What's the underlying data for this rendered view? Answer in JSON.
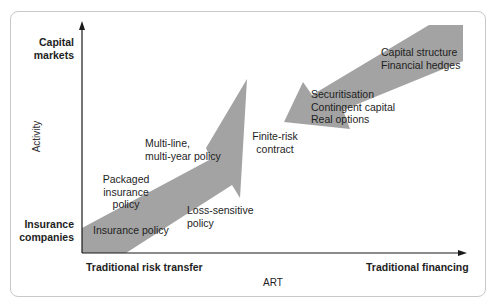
{
  "diagram": {
    "y_axis": {
      "title": "Activity",
      "top_label": [
        "Capital",
        "markets"
      ],
      "bottom_label": [
        "Insurance",
        "companies"
      ]
    },
    "x_axis": {
      "title": "ART",
      "left_label": "Traditional risk transfer",
      "right_label": "Traditional financing"
    },
    "arrows": [
      {
        "name": "risk-transfer-arrow",
        "direction": "up-right",
        "color": "#a0a0a0",
        "labels": [
          {
            "id": "insurance_policy",
            "text": "Insurance policy"
          },
          {
            "id": "packaged",
            "lines": [
              "Packaged",
              "insurance",
              "policy"
            ]
          },
          {
            "id": "multi_line",
            "lines": [
              "Multi-line,",
              "multi-year policy"
            ]
          },
          {
            "id": "loss_sensitive",
            "lines": [
              "Loss-sensitive",
              "policy"
            ]
          }
        ]
      },
      {
        "name": "financing-arrow",
        "direction": "down-left",
        "color": "#a0a0a0",
        "labels": [
          {
            "id": "capital_structure",
            "lines": [
              "Capital structure",
              "Financial hedges"
            ]
          },
          {
            "id": "securitisation",
            "lines": [
              "Securitisation",
              "Contingent capital",
              "Real options"
            ]
          }
        ]
      }
    ],
    "center_label": [
      "Finite-risk",
      "contract"
    ],
    "colors": {
      "arrow_fill": "#a0a0a0",
      "axis": "#1a1a1a",
      "frame": "#c8c8c8"
    }
  }
}
